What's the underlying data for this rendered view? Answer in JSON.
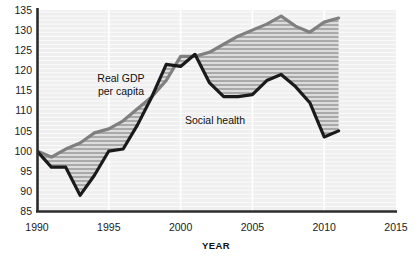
{
  "chart_data": {
    "type": "line",
    "title": "",
    "xlabel": "YEAR",
    "ylabel": "",
    "xlim": [
      1990,
      2015
    ],
    "ylim": [
      85,
      135
    ],
    "xticks": [
      1990,
      1995,
      2000,
      2005,
      2010,
      2015
    ],
    "yticks": [
      85,
      90,
      95,
      100,
      105,
      110,
      115,
      120,
      125,
      130,
      135
    ],
    "grid": true,
    "grid_style": "horizontal white rules plus vertical white rules at x ticks",
    "legend": "inline annotations on plot",
    "annotations": [
      {
        "text": "Real GDP per capita",
        "x": 1994.4,
        "y": 117.5
      },
      {
        "text": "Social health",
        "x": 2001.9,
        "y": 110.5
      }
    ],
    "fill_between": {
      "label": "gap between Real GDP per capita and Social health",
      "style": "horizontal hatch lines, gray"
    },
    "series": [
      {
        "name": "Real GDP per capita",
        "color": "#808080",
        "x": [
          1990,
          1991,
          1992,
          1993,
          1994,
          1995,
          1996,
          1997,
          1998,
          1999,
          2000,
          2001,
          2002,
          2003,
          2004,
          2005,
          2006,
          2007,
          2008,
          2009,
          2010,
          2011
        ],
        "values": [
          100,
          98.5,
          100.5,
          102,
          104.5,
          105.5,
          107.5,
          110.5,
          113.5,
          117.5,
          123.5,
          123.5,
          124.5,
          126.5,
          128.5,
          130,
          131.5,
          133.5,
          131,
          129.5,
          132,
          133
        ]
      },
      {
        "name": "Social health",
        "color": "#1a1a1a",
        "x": [
          1990,
          1991,
          1992,
          1993,
          1994,
          1995,
          1996,
          1997,
          1998,
          1999,
          2000,
          2001,
          2002,
          2003,
          2004,
          2005,
          2006,
          2007,
          2008,
          2009,
          2010,
          2011
        ],
        "values": [
          100,
          96,
          96,
          89,
          94,
          100,
          100.5,
          106.5,
          113.5,
          121.5,
          121,
          124,
          117,
          113.5,
          113.5,
          114,
          117.5,
          119,
          116,
          112,
          103.5,
          105
        ]
      }
    ]
  },
  "labels": {
    "gdp_line1": "Real GDP",
    "gdp_line2": "per capita",
    "social_health": "Social health",
    "year_axis": "YEAR"
  },
  "yticks_text": [
    "135",
    "130",
    "125",
    "120",
    "115",
    "110",
    "105",
    "100",
    "95",
    "90",
    "85"
  ],
  "xticks_text": [
    "1990",
    "1995",
    "2000",
    "2005",
    "2010",
    "2015"
  ],
  "colors": {
    "gdp": "#808080",
    "social": "#1a1a1a",
    "plot_bg": "#efefef",
    "grid": "#ffffff",
    "fill": "#b3b3b3",
    "axis": "#2b2b2b"
  }
}
